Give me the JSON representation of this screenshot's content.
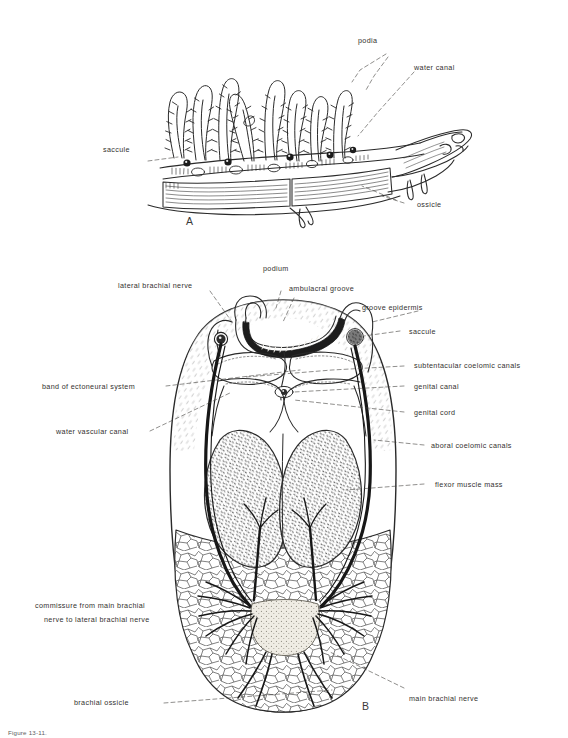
{
  "figure": {
    "panel_a_id": "A",
    "panel_b_id": "B",
    "caption": "Figure  13-11."
  },
  "panel_a": {
    "labels": [
      {
        "id": "podia",
        "text": "podia"
      },
      {
        "id": "water-canal",
        "text": "water canal"
      },
      {
        "id": "saccule",
        "text": "saccule"
      },
      {
        "id": "ossicle",
        "text": "ossicle"
      }
    ]
  },
  "panel_b": {
    "labels": [
      {
        "id": "lateral-brachial-nerve",
        "text": "lateral brachial nerve"
      },
      {
        "id": "podium",
        "text": "podium"
      },
      {
        "id": "ambulacral-groove",
        "text": "ambulacral groove"
      },
      {
        "id": "groove-epidermis",
        "text": "groove epidermis"
      },
      {
        "id": "saccule",
        "text": "saccule"
      },
      {
        "id": "subtentacular-coelomic-canals",
        "text": "subtentacular coelomic canals"
      },
      {
        "id": "genital-canal",
        "text": "genital canal"
      },
      {
        "id": "genital-cord",
        "text": "genital cord"
      },
      {
        "id": "band-of-ectoneural-system",
        "text": "band of ectoneural system"
      },
      {
        "id": "water-vascular-canal",
        "text": "water vascular canal"
      },
      {
        "id": "aboral-coelomic-canals",
        "text": "aboral coelomic canals"
      },
      {
        "id": "flexor-muscle-mass",
        "text": "flexor muscle mass"
      },
      {
        "id": "commissure-line-1",
        "text": "commissure from main brachial"
      },
      {
        "id": "commissure-line-2",
        "text": "nerve to lateral brachial nerve"
      },
      {
        "id": "brachial-ossicle",
        "text": "brachial  ossicle"
      },
      {
        "id": "main-brachial-nerve",
        "text": "main brachial nerve"
      }
    ]
  },
  "colors": {
    "ink": "#2a2a2a",
    "label": "#33312f",
    "leader": "#45433f",
    "paper": "#ffffff"
  }
}
